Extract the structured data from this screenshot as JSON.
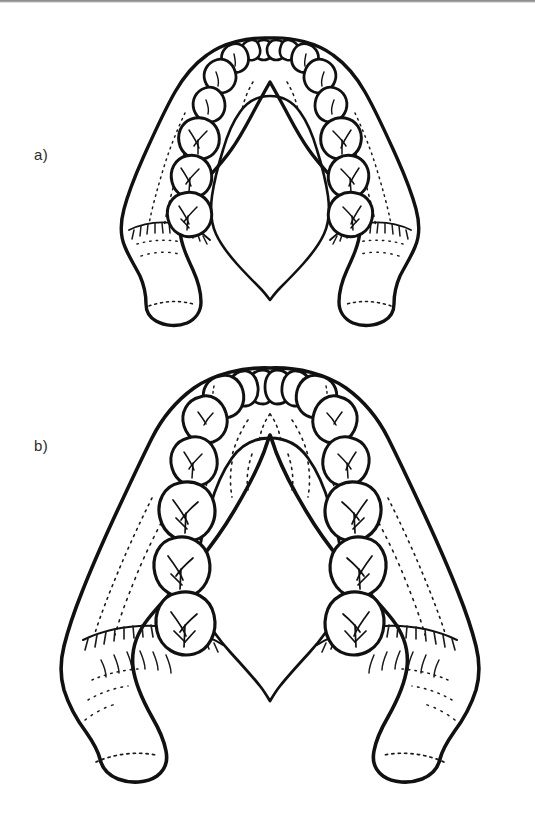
{
  "page": {
    "background_color": "#ffffff",
    "ink_color": "#111111",
    "media": "scanned textbook line drawing",
    "scan_edge_visible": true
  },
  "figure_labels": {
    "a": "a)",
    "b": "b)"
  },
  "figures": [
    {
      "id": "figure-a",
      "label": "a)",
      "caption_text": "",
      "subject": "mandible-superior-view",
      "description": "Narrow dental arch mandible, occlusal (superior) view",
      "arch_width": "narrow",
      "tooth_size": "small",
      "teeth_per_quadrant": 8,
      "quadrants": [
        "left",
        "right"
      ],
      "anatomy_features": [
        "central-incisor",
        "lateral-incisor",
        "canine",
        "first-premolar",
        "second-premolar",
        "first-molar",
        "second-molar",
        "third-molar",
        "mylohyoid-line",
        "genial-tubercle",
        "ramus",
        "condylar-head",
        "coronoid-region",
        "mandibular-body"
      ]
    },
    {
      "id": "figure-b",
      "label": "b)",
      "caption_text": "",
      "subject": "mandible-superior-view",
      "description": "Wide dental arch mandible with larger teeth, occlusal (superior) view",
      "arch_width": "wide",
      "tooth_size": "large",
      "teeth_per_quadrant": 8,
      "quadrants": [
        "left",
        "right"
      ],
      "anatomy_features": [
        "central-incisor",
        "lateral-incisor",
        "canine",
        "first-premolar",
        "second-premolar",
        "first-molar",
        "second-molar",
        "third-molar",
        "mylohyoid-line",
        "genial-tubercle",
        "ramus",
        "condylar-head",
        "mandibular-body"
      ]
    }
  ]
}
